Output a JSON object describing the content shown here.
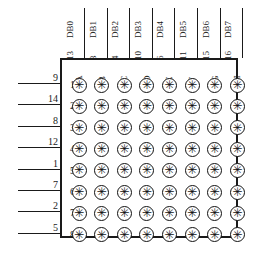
{
  "diagram": {
    "line_color": "#1a1a1a",
    "background_color": "#ffffff"
  },
  "columns": {
    "db_labels": [
      "DB0",
      "DB1",
      "DB2",
      "DB3",
      "DB4",
      "DB5",
      "DB6",
      "DB7"
    ],
    "pin_numbers": [
      "13",
      "3",
      "4",
      "10",
      "6",
      "11",
      "15",
      "16"
    ],
    "letters": [
      "A",
      "B",
      "C",
      "D",
      "E",
      "F",
      "G",
      "H"
    ]
  },
  "rows": {
    "pin_numbers": [
      "9",
      "14",
      "8",
      "12",
      "1",
      "7",
      "2",
      "5"
    ],
    "numbers": [
      "1",
      "2",
      "3",
      "4",
      "5",
      "6",
      "7",
      "8"
    ]
  },
  "led": {
    "glyph": "✳"
  }
}
